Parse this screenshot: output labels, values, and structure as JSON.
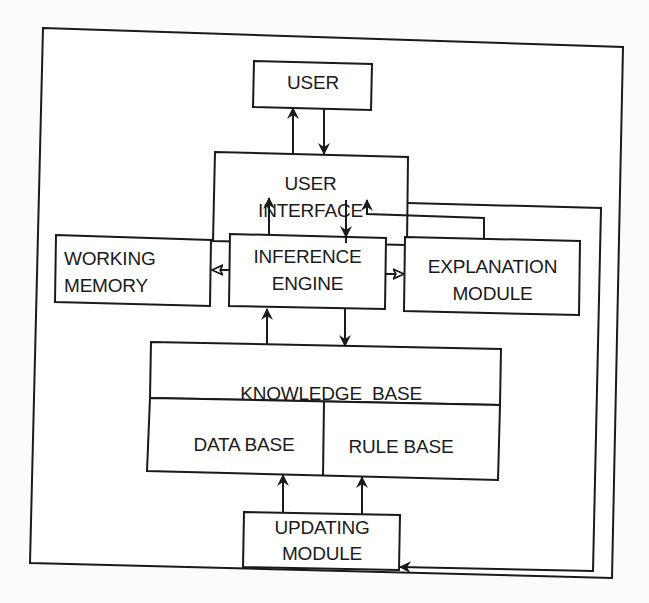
{
  "diagram": {
    "colors": {
      "stroke": "#1a1a1a",
      "background": "#fbfbf9",
      "box_fill": "#ffffff"
    },
    "nodes": {
      "user": {
        "label": "USER"
      },
      "user_interface": {
        "line1": "USER",
        "line2": "INTERFACE"
      },
      "working_memory": {
        "line1": "WORKING",
        "line2": "MEMORY"
      },
      "inference_engine": {
        "line1": "INFERENCE",
        "line2": "ENGINE"
      },
      "explanation_module": {
        "line1": "EXPLANATION",
        "line2": "MODULE"
      },
      "knowledge_base": {
        "label": "KNOWLEDGE  BASE"
      },
      "data_base": {
        "label": "DATA BASE"
      },
      "rule_base": {
        "label": "RULE BASE"
      },
      "updating_module": {
        "line1": "UPDATING",
        "line2": "MODULE"
      }
    },
    "edges": [
      {
        "from": "user_interface",
        "to": "user"
      },
      {
        "from": "user",
        "to": "user_interface"
      },
      {
        "from": "inference_engine",
        "to": "user_interface"
      },
      {
        "from": "user_interface",
        "to": "inference_engine"
      },
      {
        "from": "explanation_module",
        "to": "user_interface"
      },
      {
        "from": "inference_engine",
        "to": "working_memory"
      },
      {
        "from": "inference_engine",
        "to": "explanation_module"
      },
      {
        "from": "knowledge_base",
        "to": "inference_engine"
      },
      {
        "from": "inference_engine",
        "to": "knowledge_base"
      },
      {
        "from": "updating_module",
        "to": "data_base"
      },
      {
        "from": "updating_module",
        "to": "rule_base"
      },
      {
        "from": "user_interface",
        "to": "updating_module"
      }
    ]
  }
}
